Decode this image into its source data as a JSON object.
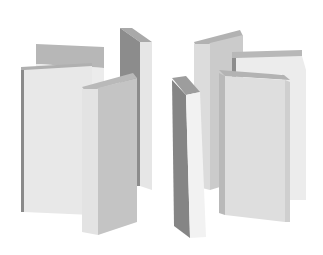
{
  "canvas": {
    "width": 323,
    "height": 255,
    "background": "#ffffff"
  },
  "palette": {
    "light_face": "#ececec",
    "mid_face": "#dedede",
    "shade_face": "#c9c9c9",
    "dark_face": "#8f8f8f",
    "darker_face": "#7a7a7a",
    "top_face": "#b5b5b5"
  },
  "slabs": [
    {
      "name": "left-back-slab",
      "faces": [
        {
          "points": "36,44 104,47 104,68 36,64",
          "fill": "#b7b7b7"
        },
        {
          "points": "36,64 104,68 104,215 36,205",
          "fill": "#ececec"
        }
      ]
    },
    {
      "name": "left-front-wide-slab",
      "faces": [
        {
          "points": "21,67 92,63 92,70 21,74",
          "fill": "#b0b0b0"
        },
        {
          "points": "21,70 24,70 24,212 21,212",
          "fill": "#8a8a8a"
        },
        {
          "points": "24,70 92,66 92,215 24,212",
          "fill": "#e8e8e8"
        }
      ]
    },
    {
      "name": "left-tall-right-slab",
      "faces": [
        {
          "points": "120,28 132,28 152,42 140,42",
          "fill": "#a9a9a9"
        },
        {
          "points": "120,28 140,42 140,186 136,186 120,178",
          "fill": "#8c8c8c"
        },
        {
          "points": "140,42 152,42 152,190 140,186",
          "fill": "#e6e6e6"
        }
      ]
    },
    {
      "name": "left-front-tall-slab",
      "faces": [
        {
          "points": "82,87 133,73 137,78 86,92",
          "fill": "#b9b9b9"
        },
        {
          "points": "82,89 98,89 98,235 82,232",
          "fill": "#e3e3e3"
        },
        {
          "points": "98,88 137,78 137,222 98,235",
          "fill": "#c4c4c4"
        }
      ]
    },
    {
      "name": "right-tall-back-slab",
      "faces": [
        {
          "points": "194,42 240,30 243,36 196,47",
          "fill": "#b2b2b2"
        },
        {
          "points": "194,44 210,44 210,190 194,186",
          "fill": "#dcdcdc"
        },
        {
          "points": "210,43 243,35 243,180 210,190",
          "fill": "#cbcbcb"
        }
      ]
    },
    {
      "name": "right-back-wide-slab",
      "faces": [
        {
          "points": "232,52 302,50 302,58 232,60",
          "fill": "#b8b8b8"
        },
        {
          "points": "232,58 236,58 236,80 232,80",
          "fill": "#8d8d8d"
        },
        {
          "points": "236,58 302,56 306,70 306,200 282,200 282,74 236,76",
          "fill": "#ececec"
        }
      ]
    },
    {
      "name": "right-front-center-slab",
      "faces": [
        {
          "points": "219,70 284,75 290,80 225,76",
          "fill": "#b3b3b3"
        },
        {
          "points": "219,73 225,76 225,215 219,213",
          "fill": "#b9b9b9"
        },
        {
          "points": "225,76 285,80 285,222 225,215",
          "fill": "#dedede"
        },
        {
          "points": "285,80 290,82 290,222 285,222",
          "fill": "#cfcfcf"
        }
      ]
    },
    {
      "name": "right-front-left-slab",
      "faces": [
        {
          "points": "172,78 186,76 200,92 186,95",
          "fill": "#9d9d9d"
        },
        {
          "points": "172,80 186,95 190,238 174,226",
          "fill": "#858585"
        },
        {
          "points": "186,95 200,92 206,237 190,238",
          "fill": "#f2f2f2"
        }
      ]
    }
  ]
}
